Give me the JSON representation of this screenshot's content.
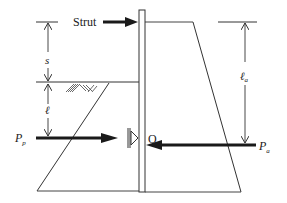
{
  "figure": {
    "type": "anchored sheet pile wall free-earth support diagram",
    "labels": {
      "strut": "Strut",
      "s": "s",
      "ell": "ℓ",
      "ell_a": "ℓ",
      "ell_a_sub": "a",
      "p_p": "P",
      "p_p_sub": "p",
      "p_a": "P",
      "p_a_sub": "a",
      "pivot": "O"
    },
    "colors": {
      "line": "#333333",
      "arrow": "#1a1a1a",
      "background": "#ffffff"
    }
  }
}
